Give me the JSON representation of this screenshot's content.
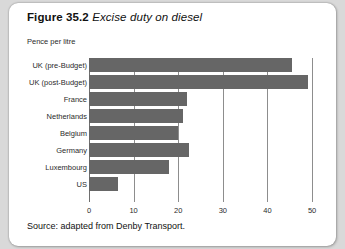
{
  "figure": {
    "number_label": "Figure 35.2",
    "caption": "Excise duty on diesel",
    "source": "Source: adapted from Denby Transport."
  },
  "colors": {
    "bar": "#666666",
    "gridline": "#8d8d8d",
    "panel_background": "#ffffff",
    "page_background": "#d9d9d9",
    "text": "#111111"
  },
  "chart_data": {
    "type": "bar",
    "orientation": "horizontal",
    "title": "Figure 35.2 Excise duty on diesel",
    "subtitle": "",
    "xlabel": "Pence per litre",
    "ylabel": "",
    "categories": [
      "UK (pre-Budget)",
      "UK (post-Budget)",
      "France",
      "Netherlands",
      "Belgium",
      "Germany",
      "Luxembourg",
      "US"
    ],
    "values": [
      45.5,
      49,
      22,
      21,
      20,
      22.5,
      18,
      6.5
    ],
    "xlim": [
      0,
      52
    ],
    "xticks": [
      0,
      10,
      20,
      30,
      40,
      50
    ],
    "xtick_labels": [
      "0",
      "10",
      "20",
      "30",
      "40",
      "50"
    ],
    "grid": "vertical",
    "legend": "none",
    "annotations": [
      "Pence per litre"
    ]
  }
}
